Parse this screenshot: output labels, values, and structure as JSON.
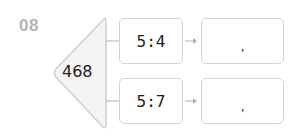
{
  "problem": {
    "number": "08",
    "total": "468",
    "rows": [
      {
        "ratio": "5:4",
        "answer_separator": ","
      },
      {
        "ratio": "5:7",
        "answer_separator": ","
      }
    ]
  },
  "colors": {
    "border": "#d4d4d4",
    "number": "#b5b5b5",
    "triangle_fill": "#f4f4f4",
    "connector": "#b0b0b0"
  }
}
